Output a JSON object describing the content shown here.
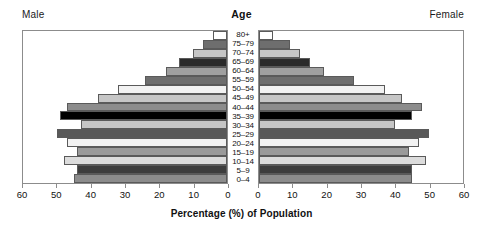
{
  "labels": {
    "male": "Male",
    "female": "Female",
    "age": "Age",
    "axis_title": "Percentage (%) of Population"
  },
  "chart_data": {
    "type": "bar",
    "subtype": "population-pyramid",
    "title": "",
    "xlabel": "Percentage (%) of Population",
    "ylabel": "Age",
    "xlim": [
      0,
      60
    ],
    "xticks": [
      0,
      10,
      20,
      30,
      40,
      50,
      60
    ],
    "grid": false,
    "legend": "none",
    "left_axis_direction": "reversed",
    "categories": [
      "80+",
      "75–79",
      "70–74",
      "65–69",
      "60–64",
      "55–59",
      "50–54",
      "45–49",
      "40–44",
      "35–39",
      "30–34",
      "25–29",
      "20–24",
      "15–19",
      "10–14",
      "5–9",
      "0–4"
    ],
    "series": [
      {
        "name": "Male",
        "side": "left",
        "values": [
          4,
          7,
          10,
          14,
          18,
          24,
          32,
          38,
          47,
          49,
          43,
          50,
          47,
          44,
          48,
          44,
          45
        ]
      },
      {
        "name": "Female",
        "side": "right",
        "values": [
          4,
          9,
          12,
          15,
          19,
          28,
          37,
          42,
          48,
          45,
          40,
          50,
          47,
          44,
          49,
          45,
          45
        ]
      }
    ],
    "bar_shades": [
      "#ffffff",
      "#6e6e6e",
      "#c6c6c6",
      "#2b2b2b",
      "#a0a0a0",
      "#6e6e6e",
      "#f2f2f2",
      "#c6c6c6",
      "#8c8c8c",
      "#000000",
      "#c6c6c6",
      "#595959",
      "#f2f2f2",
      "#9a9a9a",
      "#dcdcdc",
      "#3d3d3d",
      "#8c8c8c"
    ]
  }
}
